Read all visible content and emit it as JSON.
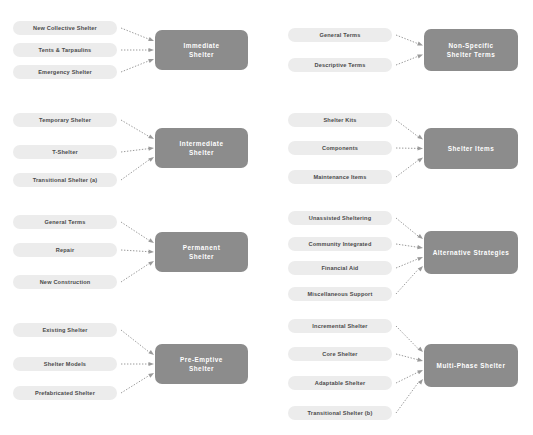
{
  "diagram": {
    "colors": {
      "background": "#ffffff",
      "pill_fill": "#ececec",
      "pill_text": "#4a4a4a",
      "node_fill": "#8c8c8c",
      "node_text": "#ffffff",
      "edge": "#9a9a9a"
    },
    "groups": [
      {
        "id": "immediate-shelter",
        "column": "left",
        "row": 1,
        "target": "Immediate Shelter",
        "target_lines": [
          "Immediate",
          "Shelter"
        ],
        "sources": [
          "New Collective Shelter",
          "Tents & Tarpaulins",
          "Emergency Shelter"
        ]
      },
      {
        "id": "non-specific-shelter-terms",
        "column": "right",
        "row": 1,
        "target": "Non-Specific Shelter Terms",
        "target_lines": [
          "Non-Specific",
          "Shelter Terms"
        ],
        "sources": [
          "General Terms",
          "Descriptive Terms"
        ]
      },
      {
        "id": "intermediate-shelter",
        "column": "left",
        "row": 2,
        "target": "Intermediate Shelter",
        "target_lines": [
          "Intermediate",
          "Shelter"
        ],
        "sources": [
          "Temporary Shelter",
          "T-Shelter",
          "Transitional Shelter (a)"
        ]
      },
      {
        "id": "shelter-items",
        "column": "right",
        "row": 2,
        "target": "Shelter Items",
        "target_lines": [
          "Shelter Items"
        ],
        "sources": [
          "Shelter Kits",
          "Components",
          "Maintenance Items"
        ]
      },
      {
        "id": "permanent-shelter",
        "column": "left",
        "row": 3,
        "target": "Permanent Shelter",
        "target_lines": [
          "Permanent",
          "Shelter"
        ],
        "sources": [
          "General Terms",
          "Repair",
          "New Construction"
        ]
      },
      {
        "id": "alternative-strategies",
        "column": "right",
        "row": 3,
        "target": "Alternative Strategies",
        "target_lines": [
          "Alternative Strategies"
        ],
        "sources": [
          "Unassisted Sheltering",
          "Community Integrated",
          "Financial Aid",
          "Miscellaneous Support"
        ]
      },
      {
        "id": "pre-emptive-shelter",
        "column": "left",
        "row": 4,
        "target": "Pre-Emptive Shelter",
        "target_lines": [
          "Pre-Emptive",
          "Shelter"
        ],
        "sources": [
          "Existing Shelter",
          "Shelter Models",
          "Prefabricated Shelter"
        ]
      },
      {
        "id": "multi-phase-shelter",
        "column": "right",
        "row": 4,
        "target": "Multi-Phase Shelter",
        "target_lines": [
          "Multi-Phase Shelter"
        ],
        "sources": [
          "Incremental Shelter",
          "Core Shelter",
          "Adaptable Shelter",
          "Transitional Shelter (b)"
        ]
      }
    ]
  },
  "layout": {
    "left": {
      "pill_x": 13,
      "pill_width": 104,
      "node_x": 155,
      "node_width": 93,
      "rows": [
        {
          "pill_ys": [
            21,
            43,
            65
          ],
          "node_y": 30,
          "node_h": 40
        },
        {
          "pill_ys": [
            113,
            145,
            173
          ],
          "node_y": 128,
          "node_h": 40
        },
        {
          "pill_ys": [
            215,
            243,
            275
          ],
          "node_y": 232,
          "node_h": 40
        },
        {
          "pill_ys": [
            323,
            357,
            386
          ],
          "node_y": 344,
          "node_h": 40
        }
      ]
    },
    "right": {
      "pill_x": 288,
      "pill_width": 104,
      "node_x": 424,
      "node_width": 94,
      "rows": [
        {
          "pill_ys": [
            28,
            58
          ],
          "node_y": 29,
          "node_h": 42
        },
        {
          "pill_ys": [
            113,
            141,
            170
          ],
          "node_y": 128,
          "node_h": 41
        },
        {
          "pill_ys": [
            211,
            237,
            261,
            287
          ],
          "node_y": 231,
          "node_h": 43
        },
        {
          "pill_ys": [
            319,
            347,
            376,
            406
          ],
          "node_y": 344,
          "node_h": 43
        }
      ]
    }
  }
}
